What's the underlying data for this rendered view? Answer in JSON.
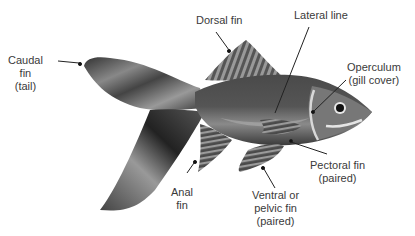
{
  "diagram": {
    "labels": [
      {
        "id": "caudal",
        "lines": [
          "Caudal",
          "fin",
          "(tail)"
        ]
      },
      {
        "id": "dorsal",
        "lines": [
          "Dorsal fin"
        ]
      },
      {
        "id": "lateral",
        "lines": [
          "Lateral line"
        ]
      },
      {
        "id": "operculum",
        "lines": [
          "Operculum",
          "(gill cover)"
        ]
      },
      {
        "id": "pectoral",
        "lines": [
          "Pectoral fin",
          "(paired)"
        ]
      },
      {
        "id": "ventral",
        "lines": [
          "Ventral or",
          "pelvic fin",
          "(paired)"
        ]
      },
      {
        "id": "anal",
        "lines": [
          "Anal",
          "fin"
        ]
      }
    ],
    "colors": {
      "body_dark": "#3c3c3c",
      "body_mid": "#6a6a6a",
      "body_light": "#b8b8b8",
      "stroke": "#222222",
      "text": "#3a3a3a"
    }
  }
}
